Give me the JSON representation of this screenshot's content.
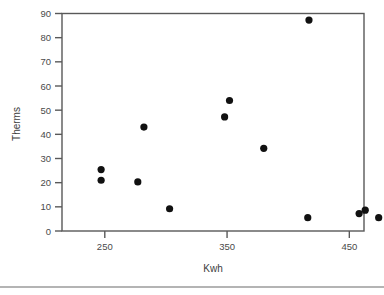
{
  "chart_data": {
    "type": "scatter",
    "title": "",
    "xlabel": "Kwh",
    "ylabel": "Therms",
    "xlim": [
      215,
      462
    ],
    "ylim": [
      0,
      90
    ],
    "xticks": [
      250,
      350,
      450
    ],
    "yticks": [
      0,
      10,
      20,
      30,
      40,
      50,
      60,
      70,
      80,
      90
    ],
    "xtick_labels": [
      "250",
      "350",
      "450"
    ],
    "ytick_labels": [
      "0",
      "10",
      "20",
      "30",
      "40",
      "50",
      "60",
      "70",
      "80",
      "90"
    ],
    "grid": false,
    "legend": null,
    "marker": "filled-circle",
    "marker_color": "#111111",
    "points": [
      {
        "x": 247,
        "y": 25.4
      },
      {
        "x": 247,
        "y": 21.0
      },
      {
        "x": 277,
        "y": 20.3
      },
      {
        "x": 282,
        "y": 43.0
      },
      {
        "x": 303,
        "y": 9.2
      },
      {
        "x": 348,
        "y": 47.2
      },
      {
        "x": 352,
        "y": 54.0
      },
      {
        "x": 380,
        "y": 34.2
      },
      {
        "x": 417,
        "y": 87.3
      },
      {
        "x": 416,
        "y": 5.5
      },
      {
        "x": 458,
        "y": 7.2
      },
      {
        "x": 463,
        "y": 8.6
      },
      {
        "x": 474,
        "y": 5.5
      }
    ]
  },
  "axes": {
    "x_axis_name": "Kwh",
    "y_axis_name": "Therms"
  }
}
